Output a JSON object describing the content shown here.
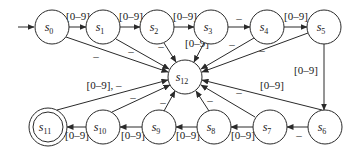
{
  "diagram": {
    "type": "finite-state-automaton",
    "start_state": "s0",
    "accepting_states": [
      "s11"
    ],
    "states": [
      {
        "id": "s0",
        "base": "s",
        "sub": "0",
        "x": 52,
        "y": 27
      },
      {
        "id": "s1",
        "base": "s",
        "sub": "1",
        "x": 103,
        "y": 27
      },
      {
        "id": "s2",
        "base": "s",
        "sub": "2",
        "x": 157,
        "y": 27
      },
      {
        "id": "s3",
        "base": "s",
        "sub": "3",
        "x": 211,
        "y": 27
      },
      {
        "id": "s4",
        "base": "s",
        "sub": "4",
        "x": 267,
        "y": 27
      },
      {
        "id": "s5",
        "base": "s",
        "sub": "5",
        "x": 324,
        "y": 27
      },
      {
        "id": "s6",
        "base": "s",
        "sub": "6",
        "x": 325,
        "y": 127
      },
      {
        "id": "s7",
        "base": "s",
        "sub": "7",
        "x": 270,
        "y": 127
      },
      {
        "id": "s8",
        "base": "s",
        "sub": "8",
        "x": 214,
        "y": 127
      },
      {
        "id": "s9",
        "base": "s",
        "sub": "9",
        "x": 159,
        "y": 127
      },
      {
        "id": "s10",
        "base": "s",
        "sub": "10",
        "x": 103,
        "y": 127
      },
      {
        "id": "s11",
        "base": "s",
        "sub": "11",
        "x": 48,
        "y": 127
      },
      {
        "id": "s12",
        "base": "s",
        "sub": "12",
        "x": 185,
        "y": 77
      }
    ],
    "transitions": [
      {
        "from": "s0",
        "to": "s1",
        "label": "[0–9]"
      },
      {
        "from": "s1",
        "to": "s2",
        "label": "[0–9]"
      },
      {
        "from": "s2",
        "to": "s3",
        "label": "[0–9]"
      },
      {
        "from": "s3",
        "to": "s4",
        "label": "–"
      },
      {
        "from": "s4",
        "to": "s5",
        "label": "[0–9]"
      },
      {
        "from": "s5",
        "to": "s6",
        "label": "[0–9]"
      },
      {
        "from": "s6",
        "to": "s7",
        "label": "–"
      },
      {
        "from": "s7",
        "to": "s8",
        "label": "[0–9]"
      },
      {
        "from": "s8",
        "to": "s9",
        "label": "[0–9]"
      },
      {
        "from": "s9",
        "to": "s10",
        "label": "[0–9]"
      },
      {
        "from": "s10",
        "to": "s11",
        "label": "[0–9]"
      },
      {
        "from": "s0",
        "to": "s12",
        "label": "–"
      },
      {
        "from": "s1",
        "to": "s12",
        "label": "–"
      },
      {
        "from": "s2",
        "to": "s12",
        "label": "–"
      },
      {
        "from": "s3",
        "to": "s12",
        "label": "[0–9]"
      },
      {
        "from": "s4",
        "to": "s12",
        "label": "–"
      },
      {
        "from": "s5",
        "to": "s12",
        "label": "–"
      },
      {
        "from": "s6",
        "to": "s12",
        "label": "[0–9]"
      },
      {
        "from": "s7",
        "to": "s12",
        "label": "–"
      },
      {
        "from": "s8",
        "to": "s12",
        "label": "–"
      },
      {
        "from": "s9",
        "to": "s12",
        "label": "–"
      },
      {
        "from": "s10",
        "to": "s12",
        "label": "–"
      },
      {
        "from": "s11",
        "to": "s12",
        "label": "[0–9], –"
      }
    ]
  },
  "labels": {
    "s0_s1": "[0–9]",
    "s1_s2": "[0–9]",
    "s2_s3": "[0–9]",
    "s3_s4": "–",
    "s4_s5": "[0–9]",
    "s5_s6": "[0–9]",
    "s6_s7": "–",
    "s7_s8": "[0–9]",
    "s8_s9": "[0–9]",
    "s9_s10": "[0–9]",
    "s10_s11": "[0–9]",
    "s0_s12": "–",
    "s1_s12": "–",
    "s2_s12": "–",
    "s3_s12": "[0–9]",
    "s4_s12": "–",
    "s5_s12": "–",
    "s6_s12": "[0–9]",
    "s7_s12": "–",
    "s8_s12": "–",
    "s9_s12": "–",
    "s10_s12": "–",
    "s11_s12": "[0–9], –"
  },
  "state_names": {
    "base": "s",
    "s0": "0",
    "s1": "1",
    "s2": "2",
    "s3": "3",
    "s4": "4",
    "s5": "5",
    "s6": "6",
    "s7": "7",
    "s8": "8",
    "s9": "9",
    "s10": "10",
    "s11": "11",
    "s12": "12"
  }
}
